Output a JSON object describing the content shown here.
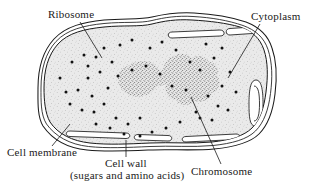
{
  "figure": {
    "background_color": "#ffffff",
    "ink_color": "#1a1a1a",
    "cytoplasm_fill": "#e9e9e9",
    "stipple_color": "#8c8c8c",
    "ribosome_color": "#111111"
  },
  "labels": {
    "ribosome": "Ribosome",
    "cytoplasm": "Cytoplasm",
    "cell_membrane": "Cell membrane",
    "cell_wall": "Cell wall",
    "cell_wall_sub": "(sugars and amino acids)",
    "chromosome": "Chromosome"
  },
  "structures": {
    "cell_wall": "cell-wall-outer-boundary",
    "cell_membrane": "cell-membrane-inner-boundary",
    "mesosomes": "membrane-infolding-loops",
    "ribosomes": "cytoplasmic-ribosome-dots",
    "chromosome": "stippled-nucleoid-region"
  },
  "ribosome_dots": [
    [
      72,
      62
    ],
    [
      84,
      55
    ],
    [
      96,
      57
    ],
    [
      104,
      48
    ],
    [
      112,
      62
    ],
    [
      100,
      72
    ],
    [
      88,
      78
    ],
    [
      78,
      90
    ],
    [
      92,
      96
    ],
    [
      108,
      88
    ],
    [
      120,
      45
    ],
    [
      132,
      40
    ],
    [
      70,
      104
    ],
    [
      82,
      110
    ],
    [
      94,
      112
    ],
    [
      104,
      104
    ],
    [
      116,
      118
    ],
    [
      128,
      124
    ],
    [
      140,
      118
    ],
    [
      150,
      48
    ],
    [
      162,
      42
    ],
    [
      176,
      50
    ],
    [
      190,
      62
    ],
    [
      200,
      70
    ],
    [
      214,
      58
    ],
    [
      222,
      48
    ],
    [
      206,
      44
    ],
    [
      230,
      72
    ],
    [
      222,
      86
    ],
    [
      236,
      92
    ],
    [
      208,
      96
    ],
    [
      218,
      106
    ],
    [
      196,
      112
    ],
    [
      180,
      122
    ],
    [
      166,
      128
    ],
    [
      152,
      132
    ],
    [
      140,
      136
    ],
    [
      124,
      134
    ],
    [
      110,
      128
    ],
    [
      96,
      124
    ],
    [
      60,
      78
    ],
    [
      66,
      92
    ],
    [
      88,
      66
    ],
    [
      118,
      76
    ],
    [
      132,
      70
    ],
    [
      146,
      66
    ],
    [
      160,
      74
    ],
    [
      172,
      86
    ],
    [
      186,
      90
    ],
    [
      200,
      118
    ],
    [
      212,
      120
    ],
    [
      228,
      110
    ]
  ]
}
